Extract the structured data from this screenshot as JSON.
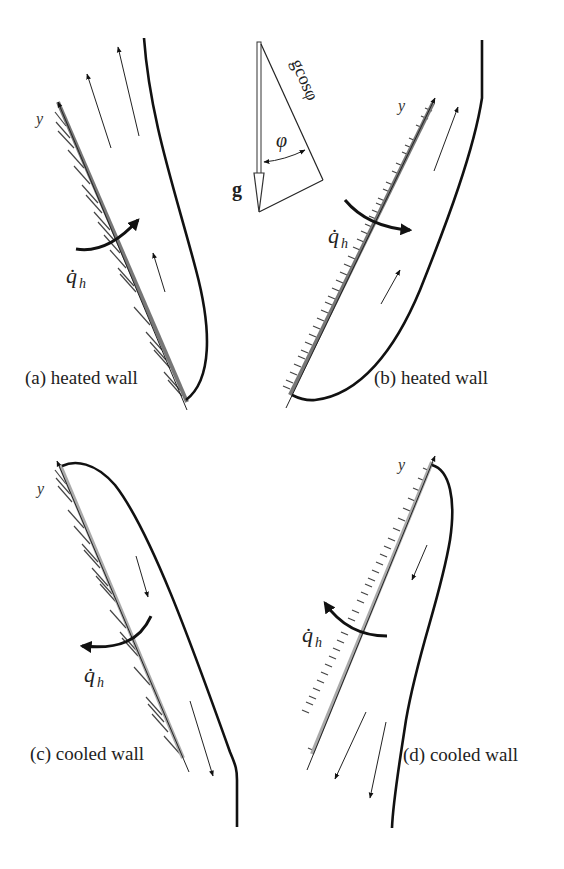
{
  "figure": {
    "gravity_inset": {
      "vector_label": "g",
      "component_label": "gcosφ",
      "angle_label": "φ"
    },
    "panels": [
      {
        "id": "a",
        "caption": "(a) heated wall",
        "axis_label": "y",
        "heat_flux_label": "q̇",
        "heat_flux_subscript": "h",
        "wall_type": "heated",
        "heat_flux_direction": "into fluid",
        "flow_direction": "up"
      },
      {
        "id": "b",
        "caption": "(b) heated wall",
        "axis_label": "y",
        "heat_flux_label": "q̇",
        "heat_flux_subscript": "h",
        "wall_type": "heated",
        "heat_flux_direction": "into fluid",
        "flow_direction": "up"
      },
      {
        "id": "c",
        "caption": "(c) cooled wall",
        "axis_label": "y",
        "heat_flux_label": "q̇",
        "heat_flux_subscript": "h",
        "wall_type": "cooled",
        "heat_flux_direction": "out of fluid",
        "flow_direction": "down"
      },
      {
        "id": "d",
        "caption": "(d) cooled wall",
        "axis_label": "y",
        "heat_flux_label": "q̇",
        "heat_flux_subscript": "h",
        "wall_type": "cooled",
        "heat_flux_direction": "out of fluid",
        "flow_direction": "down"
      }
    ]
  }
}
